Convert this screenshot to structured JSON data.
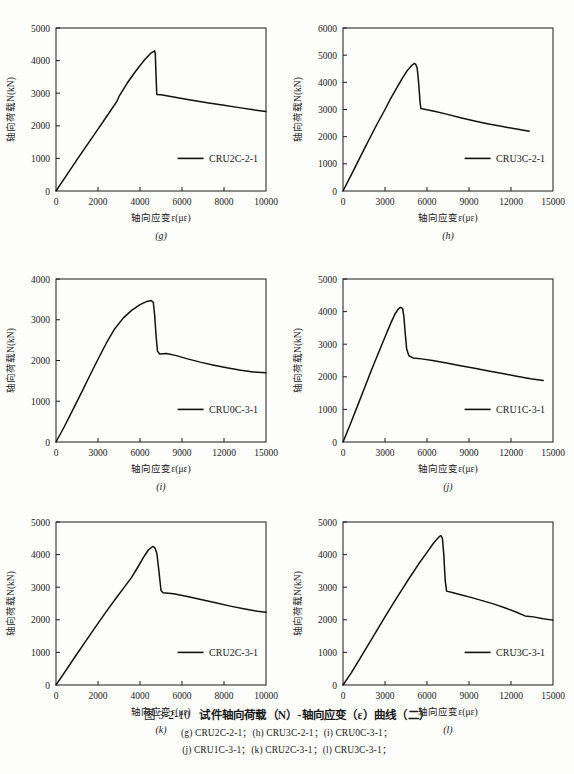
{
  "figure": {
    "caption_label": "图 3-2-10",
    "caption_title": "试件轴向荷载（N）-轴向应变（ε）曲线（二）",
    "caption_line1": "(g) CRU2C-2-1；(h) CRU3C-2-1；(i) CRU0C-3-1；",
    "caption_line2": "(j) CRU1C-3-1；(k) CRU2C-3-1；(l) CRU3C-3-1；"
  },
  "axis_labels": {
    "y": "轴向荷载N(kN)",
    "x": "轴向应变ε(με)"
  },
  "chart_data": [
    {
      "id": "g",
      "type": "line",
      "panel_letter": "(g)",
      "title": "",
      "xlabel": "轴向应变ε(με)",
      "ylabel": "轴向荷载N(kN)",
      "xlim": [
        0,
        10000
      ],
      "ylim": [
        0,
        5000
      ],
      "xticks": [
        0,
        2000,
        4000,
        6000,
        8000,
        10000
      ],
      "yticks": [
        0,
        1000,
        2000,
        3000,
        4000,
        5000
      ],
      "grid": false,
      "legend": "CRU2C-2-1",
      "legend_position": "lower-right-inside",
      "peak": {
        "x": 4700,
        "y": 4300
      },
      "series": [
        {
          "name": "CRU2C-2-1",
          "points": [
            [
              0,
              0
            ],
            [
              500,
              480
            ],
            [
              1000,
              960
            ],
            [
              1500,
              1430
            ],
            [
              2000,
              1900
            ],
            [
              2500,
              2370
            ],
            [
              2900,
              2750
            ],
            [
              3000,
              2900
            ],
            [
              3400,
              3320
            ],
            [
              3800,
              3680
            ],
            [
              4200,
              4010
            ],
            [
              4500,
              4220
            ],
            [
              4700,
              4300
            ],
            [
              4730,
              4180
            ],
            [
              4760,
              3600
            ],
            [
              4800,
              2960
            ],
            [
              5000,
              2950
            ],
            [
              5600,
              2880
            ],
            [
              6400,
              2790
            ],
            [
              7200,
              2710
            ],
            [
              8000,
              2630
            ],
            [
              8800,
              2550
            ],
            [
              9400,
              2490
            ],
            [
              10000,
              2440
            ]
          ]
        }
      ]
    },
    {
      "id": "h",
      "type": "line",
      "panel_letter": "(h)",
      "title": "",
      "xlabel": "轴向应变ε(με)",
      "ylabel": "轴向荷载N(kN)",
      "xlim": [
        0,
        15000
      ],
      "ylim": [
        0,
        6000
      ],
      "xticks": [
        0,
        3000,
        6000,
        9000,
        12000,
        15000
      ],
      "yticks": [
        0,
        1000,
        2000,
        3000,
        4000,
        5000,
        6000
      ],
      "grid": false,
      "legend": "CRU3C-2-1",
      "legend_position": "lower-right-inside",
      "peak": {
        "x": 5100,
        "y": 4700
      },
      "series": [
        {
          "name": "CRU3C-2-1",
          "points": [
            [
              0,
              0
            ],
            [
              600,
              600
            ],
            [
              1200,
              1220
            ],
            [
              1800,
              1830
            ],
            [
              2400,
              2430
            ],
            [
              3000,
              3000
            ],
            [
              3400,
              3400
            ],
            [
              3800,
              3760
            ],
            [
              4200,
              4120
            ],
            [
              4600,
              4440
            ],
            [
              4900,
              4620
            ],
            [
              5100,
              4700
            ],
            [
              5200,
              4660
            ],
            [
              5300,
              4520
            ],
            [
              5400,
              4000
            ],
            [
              5500,
              3300
            ],
            [
              5560,
              3040
            ],
            [
              6000,
              2990
            ],
            [
              6600,
              2930
            ],
            [
              7400,
              2830
            ],
            [
              8400,
              2700
            ],
            [
              9400,
              2580
            ],
            [
              10400,
              2470
            ],
            [
              11400,
              2370
            ],
            [
              12400,
              2280
            ],
            [
              13300,
              2200
            ]
          ]
        }
      ]
    },
    {
      "id": "i",
      "type": "line",
      "panel_letter": "(i)",
      "title": "",
      "xlabel": "轴向应变ε(με)",
      "ylabel": "轴向荷载N(kN)",
      "xlim": [
        0,
        15000
      ],
      "ylim": [
        0,
        4000
      ],
      "xticks": [
        0,
        3000,
        6000,
        9000,
        12000,
        15000
      ],
      "yticks": [
        0,
        1000,
        2000,
        3000,
        4000
      ],
      "grid": false,
      "legend": "CRU0C-3-1",
      "legend_position": "lower-right-inside",
      "peak": {
        "x": 6800,
        "y": 3470
      },
      "series": [
        {
          "name": "CRU0C-3-1",
          "points": [
            [
              0,
              0
            ],
            [
              600,
              380
            ],
            [
              1200,
              790
            ],
            [
              1800,
              1200
            ],
            [
              2400,
              1620
            ],
            [
              3000,
              2030
            ],
            [
              3600,
              2430
            ],
            [
              4200,
              2780
            ],
            [
              4800,
              3040
            ],
            [
              5400,
              3230
            ],
            [
              6000,
              3370
            ],
            [
              6500,
              3450
            ],
            [
              6800,
              3470
            ],
            [
              6950,
              3430
            ],
            [
              7050,
              3100
            ],
            [
              7150,
              2600
            ],
            [
              7250,
              2230
            ],
            [
              7400,
              2160
            ],
            [
              7900,
              2170
            ],
            [
              8600,
              2120
            ],
            [
              9400,
              2040
            ],
            [
              10300,
              1960
            ],
            [
              11200,
              1890
            ],
            [
              12200,
              1820
            ],
            [
              13200,
              1760
            ],
            [
              14100,
              1720
            ],
            [
              15000,
              1700
            ]
          ]
        }
      ]
    },
    {
      "id": "j",
      "type": "line",
      "panel_letter": "(j)",
      "title": "",
      "xlabel": "轴向应变ε(με)",
      "ylabel": "轴向荷载N(kN)",
      "xlim": [
        0,
        15000
      ],
      "ylim": [
        0,
        5000
      ],
      "xticks": [
        0,
        3000,
        6000,
        9000,
        12000,
        15000
      ],
      "yticks": [
        0,
        1000,
        2000,
        3000,
        4000,
        5000
      ],
      "grid": false,
      "legend": "CRU1C-3-1",
      "legend_position": "lower-right-inside",
      "peak": {
        "x": 4100,
        "y": 4130
      },
      "series": [
        {
          "name": "CRU1C-3-1",
          "points": [
            [
              0,
              0
            ],
            [
              500,
              520
            ],
            [
              1000,
              1070
            ],
            [
              1500,
              1620
            ],
            [
              2000,
              2170
            ],
            [
              2500,
              2700
            ],
            [
              3000,
              3220
            ],
            [
              3400,
              3630
            ],
            [
              3700,
              3920
            ],
            [
              3950,
              4080
            ],
            [
              4100,
              4130
            ],
            [
              4250,
              4100
            ],
            [
              4350,
              3850
            ],
            [
              4450,
              3300
            ],
            [
              4550,
              2850
            ],
            [
              4700,
              2650
            ],
            [
              5000,
              2580
            ],
            [
              5600,
              2550
            ],
            [
              6400,
              2500
            ],
            [
              7400,
              2420
            ],
            [
              8400,
              2340
            ],
            [
              9400,
              2260
            ],
            [
              10400,
              2180
            ],
            [
              11400,
              2100
            ],
            [
              12400,
              2020
            ],
            [
              13400,
              1940
            ],
            [
              14300,
              1890
            ]
          ]
        }
      ]
    },
    {
      "id": "k",
      "type": "line",
      "panel_letter": "(k)",
      "title": "",
      "xlabel": "轴向应变ε(με)",
      "ylabel": "轴向荷载N(kN)",
      "xlim": [
        0,
        10000
      ],
      "ylim": [
        0,
        5000
      ],
      "xticks": [
        0,
        2000,
        4000,
        6000,
        8000,
        10000
      ],
      "yticks": [
        0,
        1000,
        2000,
        3000,
        4000,
        5000
      ],
      "grid": false,
      "legend": "CRU2C-3-1",
      "legend_position": "lower-right-inside",
      "peak": {
        "x": 4600,
        "y": 4250
      },
      "series": [
        {
          "name": "CRU2C-3-1",
          "points": [
            [
              0,
              0
            ],
            [
              400,
              380
            ],
            [
              900,
              860
            ],
            [
              1400,
              1330
            ],
            [
              1900,
              1800
            ],
            [
              2400,
              2260
            ],
            [
              2900,
              2700
            ],
            [
              3300,
              3040
            ],
            [
              3600,
              3300
            ],
            [
              3900,
              3620
            ],
            [
              4200,
              3950
            ],
            [
              4400,
              4140
            ],
            [
              4600,
              4250
            ],
            [
              4700,
              4220
            ],
            [
              4800,
              4050
            ],
            [
              4900,
              3500
            ],
            [
              5000,
              2900
            ],
            [
              5100,
              2830
            ],
            [
              5600,
              2800
            ],
            [
              6200,
              2720
            ],
            [
              6900,
              2620
            ],
            [
              7600,
              2520
            ],
            [
              8300,
              2420
            ],
            [
              9000,
              2330
            ],
            [
              9600,
              2260
            ],
            [
              10000,
              2230
            ]
          ]
        }
      ]
    },
    {
      "id": "l",
      "type": "line",
      "panel_letter": "(l)",
      "title": "",
      "xlabel": "轴向应变ε(με)",
      "ylabel": "轴向荷载N(kN)",
      "xlim": [
        0,
        15000
      ],
      "ylim": [
        0,
        5000
      ],
      "xticks": [
        0,
        3000,
        6000,
        9000,
        12000,
        15000
      ],
      "yticks": [
        0,
        1000,
        2000,
        3000,
        4000,
        5000
      ],
      "grid": false,
      "legend": "CRU3C-3-1",
      "legend_position": "lower-right-inside",
      "peak": {
        "x": 7000,
        "y": 4580
      },
      "series": [
        {
          "name": "CRU3C-3-1",
          "points": [
            [
              0,
              0
            ],
            [
              600,
              380
            ],
            [
              1200,
              800
            ],
            [
              1800,
              1230
            ],
            [
              2400,
              1660
            ],
            [
              3000,
              2090
            ],
            [
              3600,
              2510
            ],
            [
              4200,
              2920
            ],
            [
              4800,
              3320
            ],
            [
              5400,
              3710
            ],
            [
              6000,
              4070
            ],
            [
              6500,
              4370
            ],
            [
              6900,
              4560
            ],
            [
              7000,
              4580
            ],
            [
              7100,
              4500
            ],
            [
              7200,
              4000
            ],
            [
              7300,
              3200
            ],
            [
              7400,
              2880
            ],
            [
              7800,
              2840
            ],
            [
              8400,
              2770
            ],
            [
              9200,
              2680
            ],
            [
              10000,
              2580
            ],
            [
              10800,
              2480
            ],
            [
              11600,
              2360
            ],
            [
              12400,
              2230
            ],
            [
              13000,
              2120
            ],
            [
              13600,
              2090
            ],
            [
              14300,
              2030
            ],
            [
              15000,
              1990
            ]
          ]
        }
      ]
    }
  ]
}
